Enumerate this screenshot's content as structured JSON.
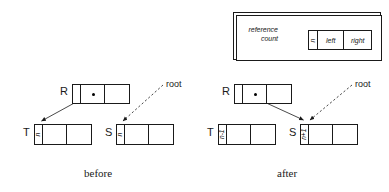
{
  "diagram": {
    "legend": {
      "caption_line1": "reference",
      "caption_line2": "count",
      "cells": {
        "count": "n",
        "left": "left",
        "right": "right"
      }
    },
    "before": {
      "caption": "before",
      "root_label": "root",
      "nodes": [
        {
          "label": "R",
          "count": ""
        },
        {
          "label": "T",
          "count": "n"
        },
        {
          "label": "S",
          "count": "n"
        }
      ]
    },
    "after": {
      "caption": "after",
      "root_label": "root",
      "nodes": [
        {
          "label": "R",
          "count": ""
        },
        {
          "label": "T",
          "count": "n-1"
        },
        {
          "label": "S",
          "count": "n+1"
        }
      ]
    }
  },
  "colors": {
    "ink": "#1a1a1a",
    "background": "#ffffff"
  }
}
